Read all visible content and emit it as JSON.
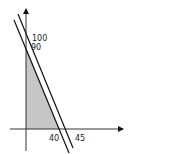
{
  "diagram": {
    "type": "linear-programming-feasible-region",
    "y_axis_labels": {
      "upper": "100",
      "lower": "90"
    },
    "x_axis_labels": {
      "left": "40",
      "right": "45"
    },
    "lines": [
      {
        "name": "constraint-1",
        "y_intercept": 90,
        "x_intercept": 40
      },
      {
        "name": "constraint-2",
        "y_intercept": 100,
        "x_intercept": 45
      }
    ],
    "shaded_region": "area under 90–40 line in first quadrant",
    "colors": {
      "shade": "#c6c6c6",
      "line": "#111111",
      "axis": "#333333"
    }
  }
}
